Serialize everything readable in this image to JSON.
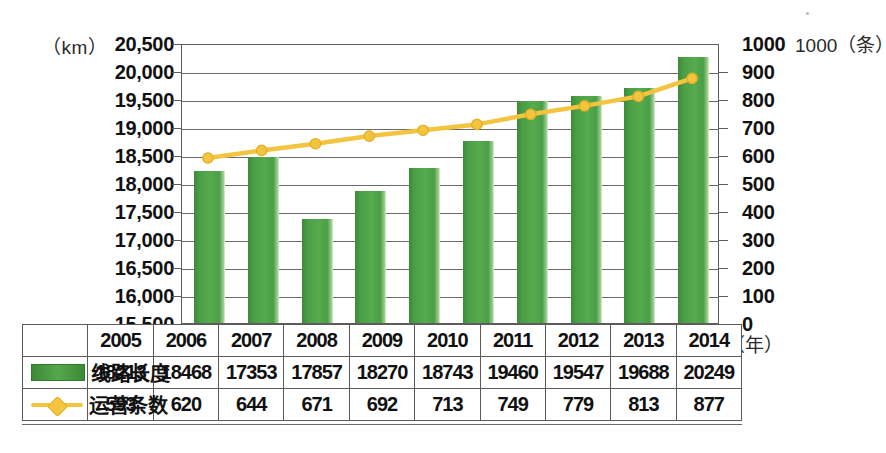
{
  "axes": {
    "left_unit": "（km）",
    "right_unit": "1000（条）",
    "x_unit": "（年）",
    "left_ticks": [
      "20,500",
      "20,000",
      "19,500",
      "19,000",
      "18,500",
      "18,000",
      "17,500",
      "17,000",
      "16,500",
      "16,000",
      "15,500"
    ],
    "right_ticks": [
      "1000",
      "900",
      "800",
      "700",
      "600",
      "500",
      "400",
      "300",
      "200",
      "100",
      "0"
    ]
  },
  "table": {
    "years_header": [
      "2005",
      "2006",
      "2007",
      "2008",
      "2009",
      "2010",
      "2011",
      "2012",
      "2013",
      "2014"
    ],
    "rows": [
      {
        "legend": "线路长度",
        "marker": "bar-swatch",
        "values": [
          "18213",
          "18468",
          "17353",
          "17857",
          "18270",
          "18743",
          "19460",
          "19547",
          "19688",
          "20249"
        ]
      },
      {
        "legend": "运营条数",
        "marker": "line-swatch",
        "values": [
          "593",
          "620",
          "644",
          "671",
          "692",
          "713",
          "749",
          "779",
          "813",
          "877"
        ]
      }
    ]
  },
  "colors": {
    "bar_green": "#4a9e46",
    "bar_green_dark": "#3d8a36",
    "bar_highlight": "#a8d49a",
    "line_gold": "#f2c43f",
    "axis_gray": "#5d5d5d"
  },
  "chart_data": {
    "type": "bar",
    "title": "",
    "xlabel": "（年）",
    "ylabel": "（km）",
    "y2label": "（条）",
    "categories": [
      "2005",
      "2006",
      "2007",
      "2008",
      "2009",
      "2010",
      "2011",
      "2012",
      "2013",
      "2014"
    ],
    "ylim": [
      15500,
      20500
    ],
    "y2lim": [
      0,
      1000
    ],
    "grid": true,
    "legend": "bottom-table",
    "series": [
      {
        "name": "线路长度",
        "type": "bar",
        "axis": "left",
        "unit": "km",
        "color": "#4a9e46",
        "values": [
          18213,
          18468,
          17353,
          17857,
          18270,
          18743,
          19460,
          19547,
          19688,
          20249
        ]
      },
      {
        "name": "运营条数",
        "type": "line",
        "axis": "right",
        "unit": "条",
        "color": "#f2c43f",
        "values": [
          593,
          620,
          644,
          671,
          692,
          713,
          749,
          779,
          813,
          877
        ]
      }
    ]
  }
}
